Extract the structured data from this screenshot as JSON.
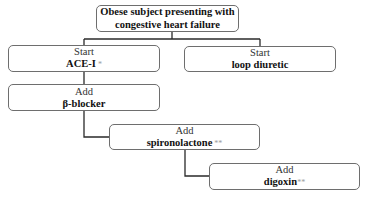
{
  "diagram": {
    "root": {
      "line1": "Obese subject presenting with",
      "line2": "congestive heart failure"
    },
    "nodes": [
      {
        "id": "ace-i",
        "action": "Start",
        "drug": "ACE-I",
        "note": "*"
      },
      {
        "id": "loop-diuretic",
        "action": "Start",
        "drug": "loop diuretic",
        "note": ""
      },
      {
        "id": "beta-blocker",
        "action": "Add",
        "drug": "β-blocker",
        "note": ""
      },
      {
        "id": "spironolactone",
        "action": "Add",
        "drug": "spironolactone",
        "note": "**"
      },
      {
        "id": "digoxin",
        "action": "Add",
        "drug": "digoxin",
        "note": "**"
      }
    ],
    "edges": [
      [
        "root",
        "ace-i"
      ],
      [
        "root",
        "loop-diuretic"
      ],
      [
        "ace-i",
        "beta-blocker"
      ],
      [
        "beta-blocker",
        "spironolactone"
      ],
      [
        "spironolactone",
        "digoxin"
      ]
    ],
    "colors": {
      "border": "#6e6e6e",
      "connector": "#2a2a2a",
      "note": "#9a9a9a"
    }
  }
}
